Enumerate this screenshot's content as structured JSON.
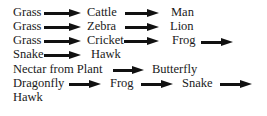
{
  "food_chains": [
    {
      "items": [
        "Grass",
        "Cattle",
        "Man"
      ],
      "trailing_arrow": false
    },
    {
      "items": [
        "Grass",
        "Zebra",
        "Lion"
      ],
      "trailing_arrow": false
    },
    {
      "items": [
        "Grass",
        "Cricket",
        "Frog"
      ],
      "trailing_arrow": true
    },
    {
      "items": [
        "Snake",
        "Hawk"
      ],
      "trailing_arrow": false
    },
    {
      "items": [
        "Nectar from Plant",
        "Butterfly"
      ],
      "trailing_arrow": false
    },
    {
      "items": [
        "Dragonfly",
        "Frog",
        "Snake"
      ],
      "trailing_arrow": true
    },
    {
      "items": [
        "Hawk"
      ],
      "trailing_arrow": false
    }
  ],
  "arrow_color": "#111111"
}
